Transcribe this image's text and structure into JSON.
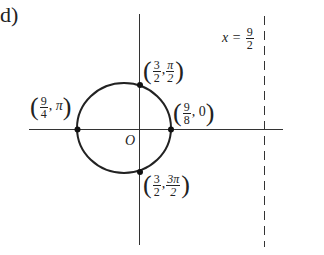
{
  "part_label": "d)",
  "axes": {
    "origin_label": "O"
  },
  "asymptote": {
    "label_var": "x =",
    "num": "9",
    "den": "2"
  },
  "points": [
    {
      "id": "top",
      "num1": "3",
      "den1": "2",
      "num2": "π",
      "den2": "2"
    },
    {
      "id": "right",
      "num1": "9",
      "den1": "8",
      "second": "0"
    },
    {
      "id": "left",
      "num1": "9",
      "den1": "4",
      "second": "π"
    },
    {
      "id": "bottom",
      "num1": "3",
      "den1": "2",
      "num2": "3π",
      "den2": "2"
    }
  ],
  "colors": {
    "stroke": "#222222"
  }
}
